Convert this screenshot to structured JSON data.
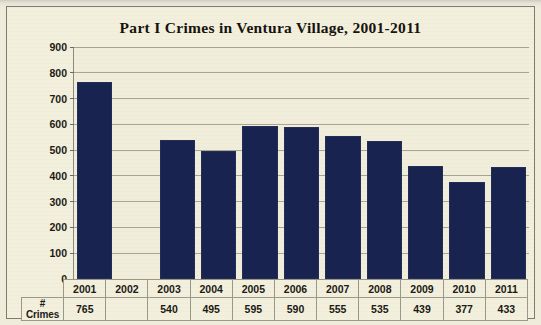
{
  "chart_data": {
    "type": "bar",
    "title": "Part I Crimes in Ventura Village, 2001-2011",
    "xlabel": "",
    "ylabel": "",
    "ylim": [
      0,
      900
    ],
    "ytick_step": 100,
    "yticks": [
      "900",
      "800",
      "700",
      "600",
      "500",
      "400",
      "300",
      "200",
      "100",
      "0"
    ],
    "grid": true,
    "legend": "none",
    "bar_color": "#182350",
    "plot_background": "#f1eddb",
    "categories": [
      "2001",
      "2002",
      "2003",
      "2004",
      "2005",
      "2006",
      "2007",
      "2008",
      "2009",
      "2010",
      "2011"
    ],
    "values": [
      765,
      null,
      540,
      495,
      595,
      590,
      555,
      535,
      439,
      377,
      433
    ],
    "value_labels": [
      "765",
      "",
      "540",
      "495",
      "595",
      "590",
      "555",
      "535",
      "439",
      "377",
      "433"
    ]
  },
  "table": {
    "row_label": "# Crimes",
    "header_row": [
      "2001",
      "2002",
      "2003",
      "2004",
      "2005",
      "2006",
      "2007",
      "2008",
      "2009",
      "2010",
      "2011"
    ],
    "value_row": [
      "765",
      "",
      "540",
      "495",
      "595",
      "590",
      "555",
      "535",
      "439",
      "377",
      "433"
    ]
  }
}
